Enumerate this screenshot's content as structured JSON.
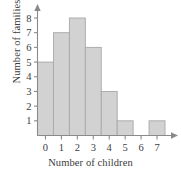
{
  "chart_data": {
    "type": "bar",
    "title": "",
    "subtitle": "",
    "xlabel": "Number of children",
    "ylabel": "Number of families",
    "categories": [
      "0",
      "1",
      "2",
      "3",
      "4",
      "5",
      "6",
      "7"
    ],
    "values": [
      5,
      7,
      8,
      6,
      3,
      1,
      0,
      1
    ],
    "series": [
      {
        "name": "Number of families",
        "values": [
          5,
          7,
          8,
          6,
          3,
          1,
          0,
          1
        ]
      }
    ],
    "xlim": [
      -0.5,
      7.5
    ],
    "ylim": [
      0,
      8
    ],
    "y_ticks": [
      "1",
      "2",
      "3",
      "4",
      "5",
      "6",
      "7",
      "8"
    ],
    "x_ticks": [
      "0",
      "1",
      "2",
      "3",
      "4",
      "5",
      "6",
      "7"
    ],
    "grid": false,
    "legend": false,
    "legend_position": "none",
    "axis_arrows": true,
    "bar_color": "#d2d2d2",
    "bar_border_color": "#a8a8a8",
    "axis_color": "#8a8a8a",
    "text_color": "#3c3c3c",
    "background_color": "#ffffff"
  },
  "labels": {
    "y_axis_title": "Number of families",
    "x_axis_title": "Number of children"
  }
}
